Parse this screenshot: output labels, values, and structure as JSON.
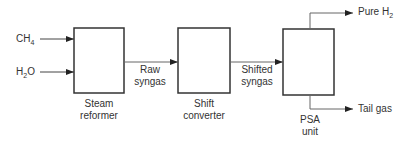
{
  "inputs": {
    "ch4": {
      "base": "CH",
      "sub": "4"
    },
    "h2o": {
      "pre": "H",
      "sub": "2",
      "post": "O"
    }
  },
  "units": [
    {
      "id": "steam-reformer",
      "line1": "Steam",
      "line2": "reformer"
    },
    {
      "id": "shift-converter",
      "line1": "Shift",
      "line2": "converter"
    },
    {
      "id": "psa-unit",
      "line1": "PSA",
      "line2": "unit"
    }
  ],
  "streams": {
    "raw_syngas": {
      "line1": "Raw",
      "line2": "syngas"
    },
    "shifted_syngas": {
      "line1": "Shifted",
      "line2": "syngas"
    }
  },
  "outputs": {
    "pure_h2": {
      "base": "Pure H",
      "sub": "2"
    },
    "tail_gas": "Tail gas"
  },
  "colors": {
    "stroke": "#333333",
    "flow": "#666666"
  }
}
